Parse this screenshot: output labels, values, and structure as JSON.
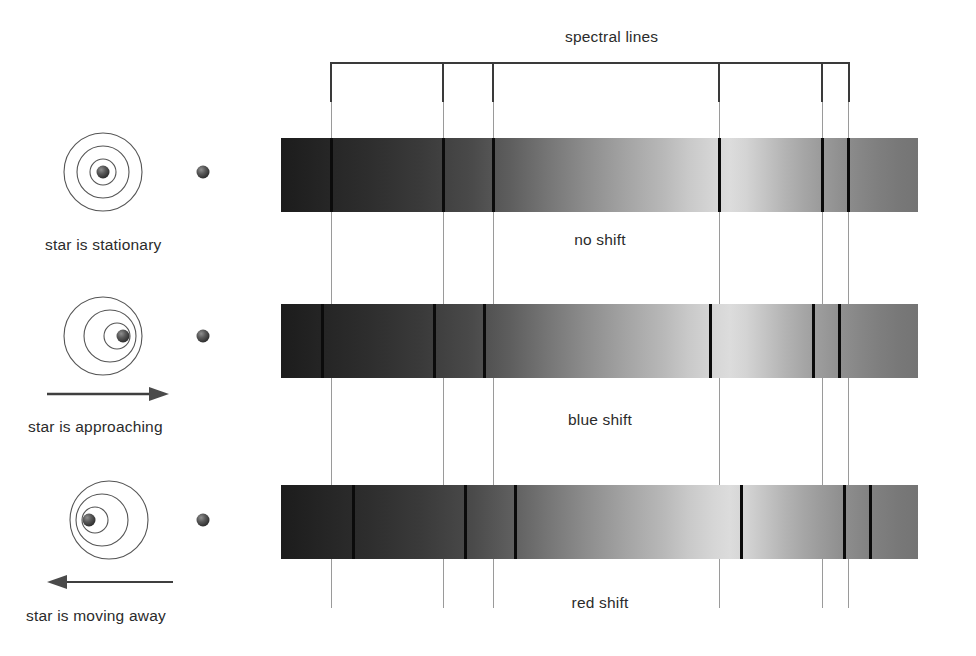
{
  "diagram": {
    "title_label": "spectral lines"
  },
  "left_panels": [
    {
      "id": "stationary",
      "caption": "star is stationary",
      "arrow": "none",
      "arrow_label": "",
      "wave_offset": 0
    },
    {
      "id": "approaching",
      "caption": "star is approaching",
      "arrow": "right",
      "arrow_label": "motion-arrow-right",
      "wave_offset": 10
    },
    {
      "id": "receding",
      "caption": "star is moving away",
      "arrow": "left",
      "arrow_label": "motion-arrow-left",
      "wave_offset": -10
    }
  ],
  "spectra": [
    {
      "id": "no-shift",
      "label": "no shift",
      "shift_px": 0,
      "line_positions": [
        331,
        443,
        493,
        719,
        822,
        848
      ]
    },
    {
      "id": "blue-shift",
      "label": "blue shift",
      "shift_px": -9,
      "line_positions": [
        322,
        434,
        484,
        710,
        813,
        839
      ]
    },
    {
      "id": "red-shift",
      "label": "red shift",
      "shift_px": 22,
      "line_positions": [
        353,
        465,
        515,
        741,
        844,
        870
      ]
    }
  ],
  "reference_lines": [
    331,
    443,
    493,
    719,
    822,
    848
  ],
  "colors": {
    "ink": "#1a1a1a",
    "line": "#0b0b0b",
    "guide": "#9a9a9a",
    "bracket": "#3a3a3a",
    "spectrum_dark": "#1c1c1c",
    "spectrum_light": "#dcdcdc"
  },
  "icons": {
    "star_sphere": "star-sphere-icon",
    "observer": "observer-dot-icon",
    "wavefront": "wavefront-circle-icon",
    "arrow_right": "arrow-right-icon",
    "arrow_left": "arrow-left-icon"
  }
}
